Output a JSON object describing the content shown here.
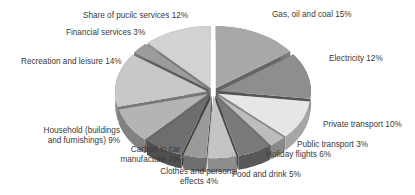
{
  "chart_data": {
    "type": "pie",
    "style": "3d-exploded",
    "title": "",
    "start_angle_deg": 0,
    "direction": "clockwise",
    "slices": [
      {
        "label": "Gas, oil and coal",
        "value": 15,
        "text": "Gas, oil and coal 15%",
        "color": "#a8a8a8"
      },
      {
        "label": "Electricity",
        "value": 12,
        "text": "Electricity 12%",
        "color": "#8e8e8e"
      },
      {
        "label": "Private transport",
        "value": 10,
        "text": "Private transport 10%",
        "color": "#e6e6e6"
      },
      {
        "label": "Public transport",
        "value": 3,
        "text": "Public transport 3%",
        "color": "#bdbdbd"
      },
      {
        "label": "Holiday flights",
        "value": 6,
        "text": "Holiday flights 6%",
        "color": "#7a7a7a"
      },
      {
        "label": "Food and drink",
        "value": 5,
        "text": "Food and drink 5%",
        "color": "#c4c4c4"
      },
      {
        "label": "Clothes and personal effects",
        "value": 4,
        "text": "Clothes and personal effects 4%",
        "color": "#9a9a9a"
      },
      {
        "label": "Carbon in car manufacture",
        "value": 7,
        "text": "Carbon in car manufacture 7%",
        "color": "#6e6e6e"
      },
      {
        "label": "Household (buildings and furnishings)",
        "value": 9,
        "text": "Household (buildings and furnishings) 9%",
        "color": "#b4b4b4"
      },
      {
        "label": "Recreation and leisure",
        "value": 14,
        "text": "Recreation and leisure 14%",
        "color": "#c8c8c8"
      },
      {
        "label": "Financial services",
        "value": 3,
        "text": "Financial services 3%",
        "color": "#9c9c9c"
      },
      {
        "label": "Share of public services",
        "value": 12,
        "text": "Share of pucilc services 12%",
        "color": "#d2d2d2"
      }
    ]
  },
  "labels": {
    "gas": "Gas, oil and coal 15%",
    "electricity": "Electricity 12%",
    "private_transport": "Private transport 10%",
    "public_transport": "Public transport 3%",
    "holiday_flights": "Holiday flights 6%",
    "food_drink": "Food and drink 5%",
    "clothes_1": "Clothes and personal",
    "clothes_2": "effects 4%",
    "carbon_1": "Carbon in car",
    "carbon_2": "manufacture 7%",
    "household_1": "Household (buildings",
    "household_2": "and furnishings) 9%",
    "recreation": "Recreation and leisure 14%",
    "financial": "Financial services 3%",
    "public_services": "Share of pucilc services 12%"
  }
}
